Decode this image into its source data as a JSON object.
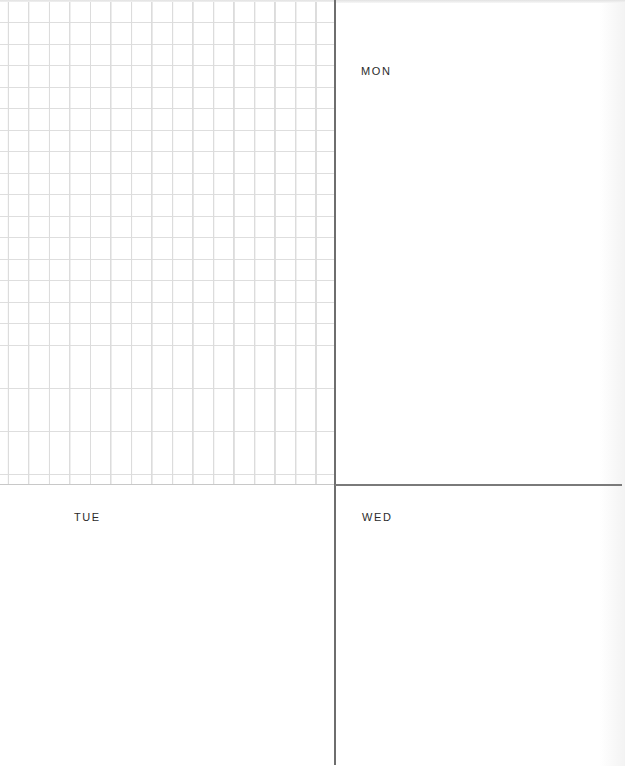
{
  "planner": {
    "notes_grid": {
      "type": "graph-paper",
      "cell_size_px": 20.5,
      "columns": 16,
      "rows": 23,
      "line_color": "#dcdcdc"
    },
    "days": [
      {
        "key": "mon",
        "label": "MON"
      },
      {
        "key": "tue",
        "label": "TUE"
      },
      {
        "key": "wed",
        "label": "WED"
      }
    ],
    "colors": {
      "paper": "#ffffff",
      "divider": "#6e6e6e",
      "label_text": "#2b2b2b"
    }
  }
}
